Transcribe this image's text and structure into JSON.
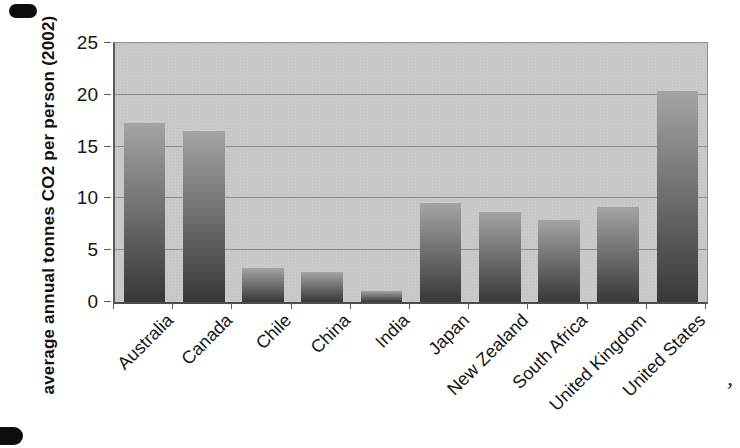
{
  "chart_data": {
    "type": "bar",
    "title": "",
    "xlabel": "",
    "ylabel": "average annual tonnes CO2 per person (2002)",
    "categories": [
      "Australia",
      "Canada",
      "Chile",
      "China",
      "India",
      "Japan",
      "New Zealand",
      "South Africa",
      "United Kingdom",
      "United States"
    ],
    "values": [
      17.3,
      16.5,
      3.3,
      2.9,
      1.1,
      9.6,
      8.7,
      7.9,
      9.2,
      20.4
    ],
    "yticks": [
      0,
      5,
      10,
      15,
      20,
      25
    ],
    "ylim": [
      0,
      25
    ],
    "grid": true,
    "legend_position": "none",
    "colors": {
      "plot_background": "#c9c9c9",
      "gridline": "#8f8f8f",
      "bar_gradient_top": "#a4a4a4",
      "bar_gradient_bottom": "#383838",
      "axis_line": "#4c4c4c",
      "text": "#161616"
    }
  },
  "artifacts": {
    "stray_mark": "’"
  }
}
